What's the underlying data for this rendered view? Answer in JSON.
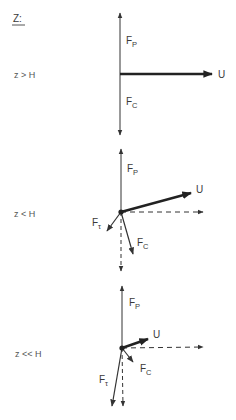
{
  "header": {
    "label": "Z:"
  },
  "colors": {
    "ink": "#333333",
    "background": "#ffffff"
  },
  "panels": [
    {
      "condition": "z > H",
      "labels": {
        "fp_main": "F",
        "fp_sub": "P",
        "fc_main": "F",
        "fc_sub": "C",
        "u": "U"
      }
    },
    {
      "condition": "z < H",
      "labels": {
        "fp_main": "F",
        "fp_sub": "P",
        "fc_main": "F",
        "fc_sub": "C",
        "ft_main": "F",
        "ft_sub": "τ",
        "u": "U"
      }
    },
    {
      "condition": "z << H",
      "labels": {
        "fp_main": "F",
        "fp_sub": "P",
        "fc_main": "F",
        "fc_sub": "C",
        "ft_main": "F",
        "ft_sub": "τ",
        "u": "U"
      }
    }
  ]
}
